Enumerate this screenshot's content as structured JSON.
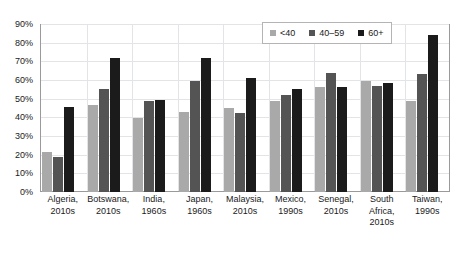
{
  "chart_data": {
    "type": "bar",
    "title": "",
    "subtitle": "",
    "xlabel": "",
    "ylabel": "",
    "ylim": [
      0,
      90
    ],
    "ytick_values": [
      0,
      10,
      20,
      30,
      40,
      50,
      60,
      70,
      80,
      90
    ],
    "ytick_labels": [
      "0%",
      "10%",
      "20%",
      "30%",
      "40%",
      "50%",
      "60%",
      "70%",
      "80%",
      "90%"
    ],
    "grid": true,
    "legend_position": "top-right",
    "categories": [
      "Algeria, 2010s",
      "Botswana, 2010s",
      "India, 1960s",
      "Japan, 1960s",
      "Malaysia, 2010s",
      "Mexico, 1990s",
      "Senegal, 2010s",
      "South Africa, 2010s",
      "Taiwan, 1990s"
    ],
    "category_lines": [
      [
        "Algeria,",
        "2010s"
      ],
      [
        "Botswana,",
        "2010s"
      ],
      [
        "India,",
        "1960s"
      ],
      [
        "Japan,",
        "1960s"
      ],
      [
        "Malaysia,",
        "2010s"
      ],
      [
        "Mexico,",
        "1990s"
      ],
      [
        "Senegal,",
        "2010s"
      ],
      [
        "South",
        "Africa,",
        "2010s"
      ],
      [
        "Taiwan,",
        "1990s"
      ]
    ],
    "series": [
      {
        "name": "<40",
        "color": "#a9a9a9",
        "values": [
          21.5,
          46.5,
          39.5,
          43.0,
          45.0,
          48.5,
          56.0,
          59.5,
          49.0
        ]
      },
      {
        "name": "40–59",
        "color": "#545454",
        "values": [
          19.0,
          55.0,
          48.5,
          59.5,
          42.5,
          52.0,
          64.0,
          57.0,
          63.0
        ]
      },
      {
        "name": "60+",
        "color": "#1b1b1b",
        "values": [
          45.5,
          72.0,
          49.5,
          72.0,
          61.0,
          55.0,
          56.0,
          58.5,
          84.0
        ]
      }
    ]
  },
  "legend": {
    "items": [
      {
        "label": "<40"
      },
      {
        "label": "40–59"
      },
      {
        "label": "60+"
      }
    ]
  }
}
